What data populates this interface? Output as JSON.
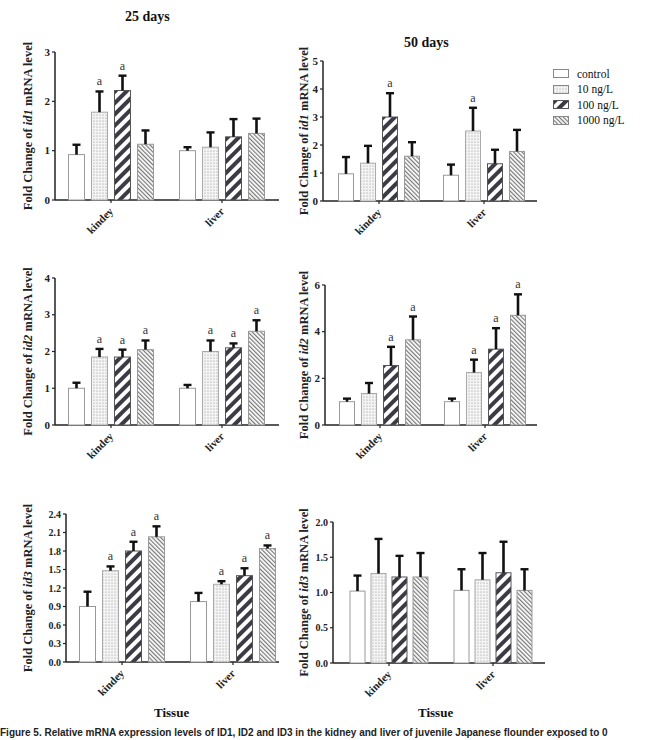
{
  "figure": {
    "column_titles": [
      "25 days",
      "50 days"
    ],
    "x_axis_label": "Tissue",
    "caption": "Figure 5. Relative mRNA expression levels of ID1, ID2 and ID3 in the kidney and liver of juvenile Japanese flounder exposed to 0",
    "legend": [
      {
        "label": "control",
        "pattern": "blank"
      },
      {
        "label": "10 ng/L",
        "pattern": "dots"
      },
      {
        "label": "100 ng/L",
        "pattern": "wide-diagonal"
      },
      {
        "label": "1000 ng/L",
        "pattern": "fine-diagonal"
      }
    ],
    "significance_marker": "a"
  },
  "chart_data": [
    {
      "type": "bar",
      "title": "25 days",
      "panel": "id1-25d",
      "ylabel_prefix": "Fold Change of ",
      "ylabel_gene": "id1",
      "ylabel_suffix": " mRNA level",
      "xlabel": "",
      "categories": [
        "kindey",
        "liver"
      ],
      "ylim": [
        0,
        3
      ],
      "yticks": [
        "0",
        "1",
        "2",
        "3"
      ],
      "series": [
        {
          "name": "control",
          "values": [
            0.92,
            1.0
          ],
          "errors": [
            0.2,
            0.07
          ],
          "sig": [
            "",
            ""
          ]
        },
        {
          "name": "10 ng/L",
          "values": [
            1.78,
            1.07
          ],
          "errors": [
            0.42,
            0.3
          ],
          "sig": [
            "a",
            ""
          ]
        },
        {
          "name": "100 ng/L",
          "values": [
            2.22,
            1.28
          ],
          "errors": [
            0.3,
            0.36
          ],
          "sig": [
            "a",
            ""
          ]
        },
        {
          "name": "1000 ng/L",
          "values": [
            1.13,
            1.35
          ],
          "errors": [
            0.28,
            0.3
          ],
          "sig": [
            "",
            ""
          ]
        }
      ]
    },
    {
      "type": "bar",
      "title": "50 days",
      "panel": "id1-50d",
      "ylabel_prefix": "Fold Change of ",
      "ylabel_gene": "id1",
      "ylabel_suffix": " mRNA level",
      "xlabel": "",
      "categories": [
        "kindey",
        "liver"
      ],
      "ylim": [
        0,
        5
      ],
      "yticks": [
        "0",
        "1",
        "2",
        "3",
        "4",
        "5"
      ],
      "series": [
        {
          "name": "control",
          "values": [
            0.97,
            0.92
          ],
          "errors": [
            0.6,
            0.38
          ],
          "sig": [
            "",
            ""
          ]
        },
        {
          "name": "10 ng/L",
          "values": [
            1.35,
            2.5
          ],
          "errors": [
            0.62,
            0.83
          ],
          "sig": [
            "",
            "a"
          ]
        },
        {
          "name": "100 ng/L",
          "values": [
            3.0,
            1.33
          ],
          "errors": [
            0.85,
            0.5
          ],
          "sig": [
            "a",
            ""
          ]
        },
        {
          "name": "1000 ng/L",
          "values": [
            1.6,
            1.77
          ],
          "errors": [
            0.5,
            0.77
          ],
          "sig": [
            "",
            ""
          ]
        }
      ]
    },
    {
      "type": "bar",
      "title": "",
      "panel": "id2-25d",
      "ylabel_prefix": "Fold Change of ",
      "ylabel_gene": "id2",
      "ylabel_suffix": " mRNA level",
      "xlabel": "",
      "categories": [
        "kindey",
        "liver"
      ],
      "ylim": [
        0,
        4
      ],
      "yticks": [
        "0",
        "1",
        "2",
        "3",
        "4"
      ],
      "series": [
        {
          "name": "control",
          "values": [
            1.0,
            1.0
          ],
          "errors": [
            0.15,
            0.09
          ],
          "sig": [
            "",
            ""
          ]
        },
        {
          "name": "10 ng/L",
          "values": [
            1.85,
            2.0
          ],
          "errors": [
            0.22,
            0.3
          ],
          "sig": [
            "a",
            "a"
          ]
        },
        {
          "name": "100 ng/L",
          "values": [
            1.85,
            2.1
          ],
          "errors": [
            0.2,
            0.12
          ],
          "sig": [
            "a",
            "a"
          ]
        },
        {
          "name": "1000 ng/L",
          "values": [
            2.05,
            2.55
          ],
          "errors": [
            0.25,
            0.3
          ],
          "sig": [
            "a",
            "a"
          ]
        }
      ]
    },
    {
      "type": "bar",
      "title": "",
      "panel": "id2-50d",
      "ylabel_prefix": "Fold Change of ",
      "ylabel_gene": "id2",
      "ylabel_suffix": " mRNA level",
      "xlabel": "",
      "categories": [
        "kindey",
        "liver"
      ],
      "ylim": [
        0,
        6
      ],
      "yticks": [
        "0",
        "2",
        "4",
        "6"
      ],
      "series": [
        {
          "name": "control",
          "values": [
            1.0,
            1.0
          ],
          "errors": [
            0.13,
            0.13
          ],
          "sig": [
            "",
            ""
          ]
        },
        {
          "name": "10 ng/L",
          "values": [
            1.35,
            2.25
          ],
          "errors": [
            0.45,
            0.55
          ],
          "sig": [
            "",
            "a"
          ]
        },
        {
          "name": "100 ng/L",
          "values": [
            2.55,
            3.25
          ],
          "errors": [
            0.8,
            0.9
          ],
          "sig": [
            "a",
            "a"
          ]
        },
        {
          "name": "1000 ng/L",
          "values": [
            3.65,
            4.7
          ],
          "errors": [
            1.0,
            0.9
          ],
          "sig": [
            "a",
            "a"
          ]
        }
      ]
    },
    {
      "type": "bar",
      "title": "",
      "panel": "id3-25d",
      "ylabel_prefix": "Fold Change of ",
      "ylabel_gene": "id3",
      "ylabel_suffix": " mRNA level",
      "xlabel": "Tissue",
      "categories": [
        "kindey",
        "liver"
      ],
      "ylim": [
        0,
        2.4
      ],
      "yticks": [
        "0.0",
        "0.3",
        "0.6",
        "0.9",
        "1.2",
        "1.5",
        "1.8",
        "2.1",
        "2.4"
      ],
      "series": [
        {
          "name": "control",
          "values": [
            0.9,
            0.98
          ],
          "errors": [
            0.24,
            0.14
          ],
          "sig": [
            "",
            ""
          ]
        },
        {
          "name": "10 ng/L",
          "values": [
            1.48,
            1.26
          ],
          "errors": [
            0.07,
            0.05
          ],
          "sig": [
            "a",
            "a"
          ]
        },
        {
          "name": "100 ng/L",
          "values": [
            1.8,
            1.4
          ],
          "errors": [
            0.15,
            0.12
          ],
          "sig": [
            "a",
            "a"
          ]
        },
        {
          "name": "1000 ng/L",
          "values": [
            2.03,
            1.84
          ],
          "errors": [
            0.17,
            0.05
          ],
          "sig": [
            "a",
            "a"
          ]
        }
      ]
    },
    {
      "type": "bar",
      "title": "",
      "panel": "id3-50d",
      "ylabel_prefix": "Fold Change of ",
      "ylabel_gene": "id3",
      "ylabel_suffix": " mRNA level",
      "xlabel": "Tissue",
      "categories": [
        "kindey",
        "liver"
      ],
      "ylim": [
        0,
        2.0
      ],
      "yticks": [
        "0.0",
        "0.5",
        "1.0",
        "1.5",
        "2.0"
      ],
      "series": [
        {
          "name": "control",
          "values": [
            1.02,
            1.03
          ],
          "errors": [
            0.22,
            0.3
          ],
          "sig": [
            "",
            ""
          ]
        },
        {
          "name": "10 ng/L",
          "values": [
            1.27,
            1.18
          ],
          "errors": [
            0.49,
            0.38
          ],
          "sig": [
            "",
            ""
          ]
        },
        {
          "name": "100 ng/L",
          "values": [
            1.22,
            1.28
          ],
          "errors": [
            0.3,
            0.44
          ],
          "sig": [
            "",
            ""
          ]
        },
        {
          "name": "1000 ng/L",
          "values": [
            1.22,
            1.03
          ],
          "errors": [
            0.34,
            0.3
          ],
          "sig": [
            "",
            ""
          ]
        }
      ]
    }
  ]
}
